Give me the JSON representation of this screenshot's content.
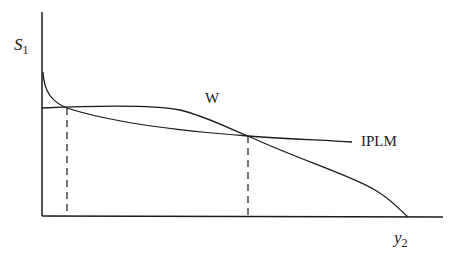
{
  "diagram": {
    "axes": {
      "y_label_base": "S",
      "y_label_sub": "1",
      "x_label_base": "y",
      "x_label_sub": "2"
    },
    "curves": [
      {
        "name": "W",
        "label": "W"
      },
      {
        "name": "IPLM",
        "label": "IPLM"
      }
    ],
    "intersections": [
      {
        "x_px": 67,
        "y_px": 108
      },
      {
        "x_px": 248,
        "y_px": 136
      }
    ],
    "colors": {
      "line": "#1a1a1a",
      "background": "#ffffff"
    }
  }
}
